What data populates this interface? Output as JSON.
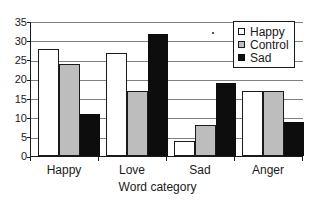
{
  "chart_data": {
    "type": "bar",
    "title": "",
    "xlabel": "Word category",
    "ylabel": "",
    "categories": [
      "Happy",
      "Love",
      "Sad",
      "Anger"
    ],
    "series": [
      {
        "name": "Happy",
        "values": [
          28,
          27,
          4,
          17
        ],
        "color": "#ffffff"
      },
      {
        "name": "Control",
        "values": [
          24,
          17,
          8,
          17
        ],
        "color": "#bdbdbd"
      },
      {
        "name": "Sad",
        "values": [
          11,
          32,
          19,
          9
        ],
        "color": "#0d0d0d"
      }
    ],
    "ylim": [
      0,
      35
    ],
    "ytick_labels": [
      "0",
      "5",
      "10",
      "15",
      "20",
      "25",
      "30",
      "35"
    ],
    "ytick_values": [
      0,
      5,
      10,
      15,
      20,
      25,
      30,
      35
    ],
    "grid": "horizontal",
    "legend_position": "top-right",
    "legend_entries": [
      "Happy",
      "Control",
      "Sad"
    ]
  },
  "axis": {
    "y_labels": {
      "t0": "0",
      "t1": "5",
      "t2": "10",
      "t3": "15",
      "t4": "20",
      "t5": "25",
      "t6": "30",
      "t7": "35"
    },
    "x_labels": {
      "c0": "Happy",
      "c1": "Love",
      "c2": "Sad",
      "c3": "Anger"
    },
    "x_title": "Word category"
  },
  "legend": {
    "items": [
      {
        "label": "Happy"
      },
      {
        "label": "Control"
      },
      {
        "label": "Sad"
      }
    ]
  }
}
